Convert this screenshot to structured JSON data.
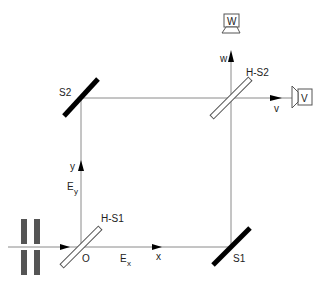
{
  "diagram": {
    "type": "Mach-Zehnder interferometer",
    "colors": {
      "beam": "#8a8a8a",
      "mirror": "#000000",
      "slit": "#555555",
      "text": "#222222",
      "outline": "#555555"
    },
    "components": {
      "mirror_s1": {
        "label": "S1"
      },
      "mirror_s2": {
        "label": "S2"
      },
      "beamsplitter_1": {
        "label": "H-S1"
      },
      "beamsplitter_2": {
        "label": "H-S2"
      },
      "origin": {
        "label": "O"
      },
      "detector_w": {
        "label": "W"
      },
      "detector_v": {
        "label": "V"
      }
    },
    "axes": {
      "x": {
        "label": "x"
      },
      "y": {
        "label": "y"
      },
      "v": {
        "label": "v"
      },
      "w": {
        "label": "w"
      }
    },
    "fields": {
      "ex": {
        "main": "E",
        "sub": "x"
      },
      "ey": {
        "main": "E",
        "sub": "y"
      }
    }
  }
}
